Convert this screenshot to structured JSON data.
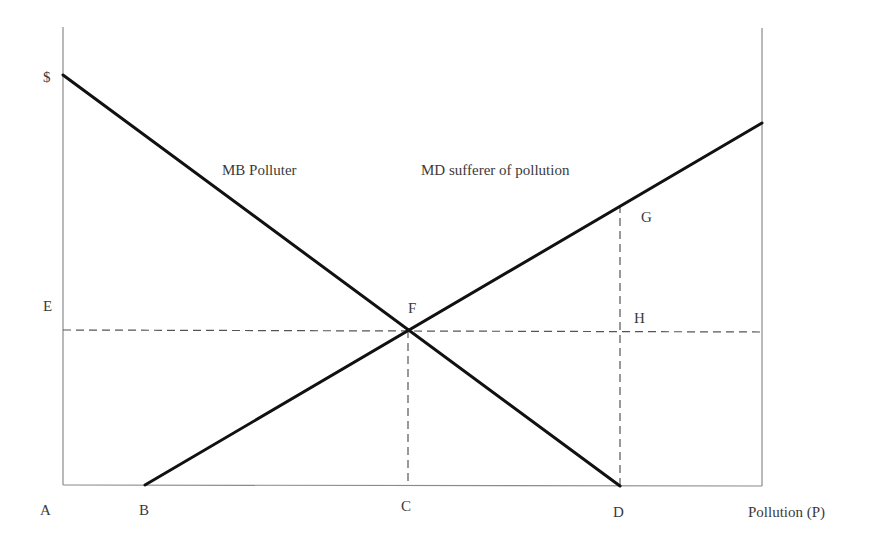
{
  "diagram": {
    "type": "economics-supply-demand",
    "axes": {
      "y_label": "$",
      "x_label": "Pollution (P)",
      "origin_label": "A"
    },
    "curves": [
      {
        "name": "MB Polluter",
        "label": "MB Polluter",
        "direction": "downward",
        "from_point": "$ (y-intercept)",
        "to_point": "D"
      },
      {
        "name": "MD sufferer of pollution",
        "label": "MD sufferer of pollution",
        "direction": "upward",
        "from_point": "B",
        "to_point": "right edge"
      }
    ],
    "points": {
      "A": "A",
      "B": "B",
      "C": "C",
      "D": "D",
      "E": "E",
      "F": "F",
      "G": "G",
      "H": "H"
    },
    "guides": [
      {
        "type": "horizontal-dashed",
        "from": "E",
        "through": [
          "F",
          "H"
        ]
      },
      {
        "type": "vertical-dashed",
        "from": "F",
        "to": "C"
      },
      {
        "type": "vertical-dashed",
        "from": "G",
        "to": "D",
        "through": [
          "H"
        ]
      }
    ]
  },
  "colors": {
    "curve": "#111111",
    "axis": "#8a8a8a",
    "dash": "#555555",
    "text": "#3a3a3a"
  }
}
